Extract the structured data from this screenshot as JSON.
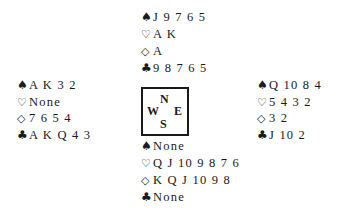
{
  "suit_symbols": {
    "spades": "♠",
    "hearts": "♡",
    "diamonds": "◇",
    "clubs": "♣"
  },
  "hands": {
    "north": {
      "spades": "J 9 7 6 5",
      "hearts": "A K",
      "diamonds": "A",
      "clubs": "9 8 7 6 5"
    },
    "west": {
      "spades": "A K 3 2",
      "hearts": "None",
      "diamonds": "7 6 5 4",
      "clubs": "A K Q 4 3"
    },
    "east": {
      "spades": "Q 10 8 4",
      "hearts": "5 4 3 2",
      "diamonds": "3 2",
      "clubs": "J 10 2"
    },
    "south": {
      "spades": "None",
      "hearts": "Q J 10 9 8 7 6",
      "diamonds": "K Q J 10 9 8",
      "clubs": "None"
    }
  },
  "compass": {
    "north": "N",
    "west": "W",
    "east": "E",
    "south": "S"
  }
}
